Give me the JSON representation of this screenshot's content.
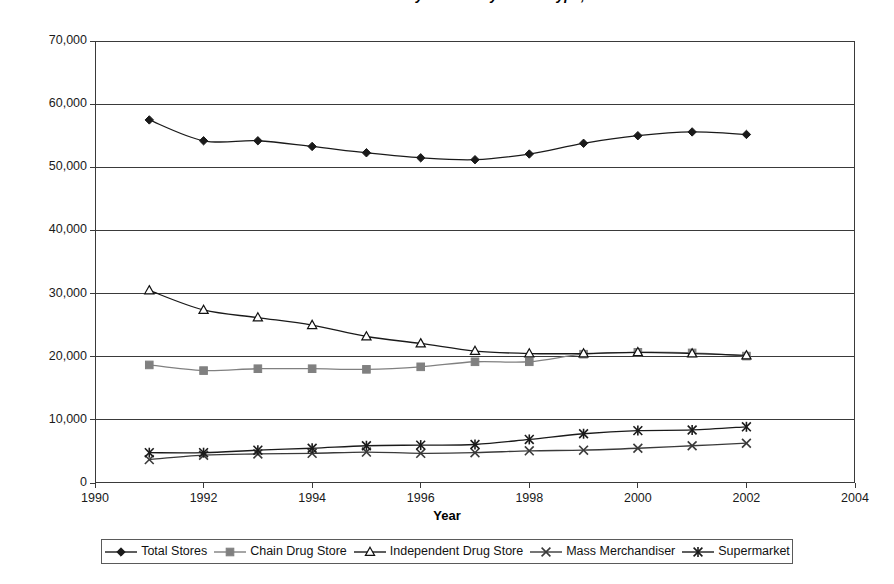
{
  "chart_data": {
    "type": "line",
    "title": "Number of Retail Pharmacy Outlets by Outlet Type, 1991-2002",
    "xlabel": "Year",
    "ylabel": "",
    "xlim": [
      1990,
      2004
    ],
    "ylim": [
      0,
      70000
    ],
    "xticks": [
      1990,
      1992,
      1994,
      1996,
      1998,
      2000,
      2002,
      2004
    ],
    "yticks": [
      0,
      10000,
      20000,
      30000,
      40000,
      50000,
      60000,
      70000
    ],
    "ytick_labels": [
      "0",
      "10,000",
      "20,000",
      "30,000",
      "40,000",
      "50,000",
      "60,000",
      "70,000"
    ],
    "xtick_labels": [
      "1990",
      "1992",
      "1994",
      "1996",
      "1998",
      "2000",
      "2002",
      "2004"
    ],
    "grid": "horizontal",
    "legend_position": "bottom",
    "x": [
      1991,
      1992,
      1993,
      1994,
      1995,
      1996,
      1997,
      1998,
      1999,
      2000,
      2001,
      2002
    ],
    "series": [
      {
        "name": "Total Stores",
        "marker": "diamond",
        "color": "#1a1a1a",
        "values": [
          57500,
          54200,
          54200,
          53300,
          52300,
          51500,
          51200,
          52100,
          53800,
          55000,
          55600,
          55200
        ]
      },
      {
        "name": "Chain Drug Store",
        "marker": "square",
        "color": "#808080",
        "values": [
          18700,
          17800,
          18100,
          18100,
          18000,
          18400,
          19200,
          19200,
          20400,
          20700,
          20600,
          20100
        ]
      },
      {
        "name": "Independent Drug Store",
        "marker": "triangle",
        "color": "#1a1a1a",
        "values": [
          30500,
          27400,
          26200,
          25000,
          23200,
          22100,
          20900,
          20500,
          20500,
          20700,
          20500,
          20200
        ]
      },
      {
        "name": "Mass Merchandiser",
        "marker": "x",
        "color": "#3a3a3a",
        "values": [
          3700,
          4400,
          4600,
          4700,
          4900,
          4700,
          4800,
          5100,
          5200,
          5500,
          5900,
          6300
        ]
      },
      {
        "name": "Supermarket",
        "marker": "asterisk",
        "color": "#1a1a1a",
        "values": [
          4800,
          4800,
          5200,
          5500,
          5900,
          6000,
          6100,
          6900,
          7800,
          8300,
          8400,
          8900
        ]
      }
    ]
  },
  "legend": {
    "items": [
      {
        "label": "Total Stores"
      },
      {
        "label": "Chain Drug Store"
      },
      {
        "label": "Independent Drug Store"
      },
      {
        "label": "Mass Merchandiser"
      },
      {
        "label": "Supermarket"
      }
    ]
  }
}
